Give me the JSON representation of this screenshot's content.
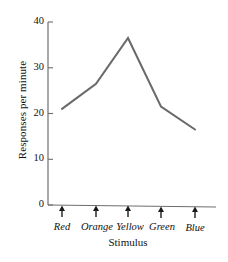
{
  "chart_data": {
    "type": "line",
    "title": "",
    "xlabel": "Stimulus",
    "ylabel": "Responses per minute",
    "categories": [
      "Red",
      "Orange",
      "Yellow",
      "Green",
      "Blue"
    ],
    "values": [
      21,
      26.5,
      36.5,
      21.5,
      16.5
    ],
    "series": [
      {
        "name": "Responses per minute",
        "values": [
          21,
          26.5,
          36.5,
          21.5,
          16.5
        ]
      }
    ],
    "ylim": [
      0,
      40
    ],
    "yticks": [
      0,
      10,
      20,
      30,
      40
    ],
    "ytick_labels": [
      "0",
      "10",
      "20",
      "30",
      "40"
    ],
    "grid": false,
    "legend": false,
    "legend_position": "none",
    "line_color": "#6a6a6a",
    "axis_color": "#6e6e6e",
    "text_color": "#111111",
    "marker": "none",
    "x_tick_style": "up-arrow",
    "annotations": []
  }
}
